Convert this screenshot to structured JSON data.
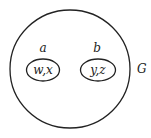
{
  "diagram": {
    "outer_set": {
      "label": "G"
    },
    "inner_sets": [
      {
        "label": "a",
        "contents": "w,x"
      },
      {
        "label": "b",
        "contents": "y,z"
      }
    ],
    "stroke_color": "#222222"
  }
}
